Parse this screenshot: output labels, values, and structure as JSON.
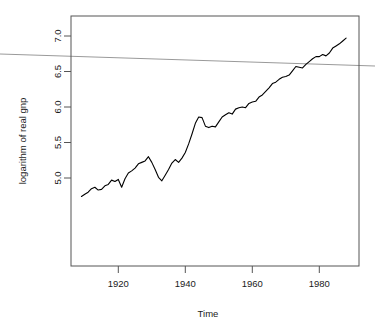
{
  "chart_data": {
    "type": "line",
    "title": "",
    "xlabel": "Time",
    "ylabel": "logarithm of real gnp",
    "xlim": [
      1906,
      1992
    ],
    "ylim": [
      4.52,
      7.28
    ],
    "xticks": [
      1920,
      1940,
      1960,
      1980
    ],
    "xtick_labels": [
      "1920",
      "1940",
      "1960",
      "1980"
    ],
    "yticks": [
      5.0,
      5.5,
      6.0,
      6.5,
      7.0
    ],
    "ytick_labels": [
      "5.0",
      "5.5",
      "6.0",
      "6.5",
      "7.0"
    ],
    "grid": false,
    "legend": null,
    "line_color": "#000000",
    "series": [
      {
        "name": "logarithm of real gnp",
        "x": [
          1909,
          1910,
          1911,
          1912,
          1913,
          1914,
          1915,
          1916,
          1917,
          1918,
          1919,
          1920,
          1921,
          1922,
          1923,
          1924,
          1925,
          1926,
          1927,
          1928,
          1929,
          1930,
          1931,
          1932,
          1933,
          1934,
          1935,
          1936,
          1937,
          1938,
          1939,
          1940,
          1941,
          1942,
          1943,
          1944,
          1945,
          1946,
          1947,
          1948,
          1949,
          1950,
          1951,
          1952,
          1953,
          1954,
          1955,
          1956,
          1957,
          1958,
          1959,
          1960,
          1961,
          1962,
          1963,
          1964,
          1965,
          1966,
          1967,
          1968,
          1969,
          1970,
          1971,
          1972,
          1973,
          1974,
          1975,
          1976,
          1977,
          1978,
          1979,
          1980,
          1981,
          1982,
          1983,
          1984,
          1985,
          1986,
          1987,
          1988
        ],
        "values": [
          4.74,
          4.77,
          4.8,
          4.85,
          4.87,
          4.83,
          4.84,
          4.89,
          4.91,
          4.97,
          4.95,
          4.98,
          4.87,
          4.99,
          5.07,
          5.1,
          5.14,
          5.2,
          5.22,
          5.24,
          5.3,
          5.22,
          5.12,
          5.01,
          4.96,
          5.04,
          5.12,
          5.21,
          5.26,
          5.22,
          5.28,
          5.36,
          5.48,
          5.62,
          5.77,
          5.86,
          5.85,
          5.73,
          5.71,
          5.73,
          5.72,
          5.79,
          5.86,
          5.89,
          5.92,
          5.9,
          5.97,
          5.99,
          6.0,
          5.99,
          6.05,
          6.07,
          6.08,
          6.14,
          6.17,
          6.22,
          6.27,
          6.33,
          6.35,
          6.39,
          6.42,
          6.43,
          6.45,
          6.51,
          6.57,
          6.56,
          6.55,
          6.6,
          6.64,
          6.68,
          6.71,
          6.71,
          6.74,
          6.72,
          6.76,
          6.83,
          6.86,
          6.89,
          6.93,
          6.97
        ],
        "points_px": "71,257 74,252 77,248 81,242 84,239 88,244 91,243 95,236 98,233 101,228 105,230 108,226 111,242 115,225 118,214 121,210 125,205 128,196 131,194 135,191 138,182 141,194 145,208 148,223 151,230 155,218 158,208 161,196 165,189 168,196 171,187 175,176 178,159 181,138 185,117 188,104 191,106 195,123 198,125 201,123 205,124 208,114 211,104 215,100 218,096 221,099 225,089 228,087 231,085 235,087 238,079 241,076 245,075 248,066 251,061 255,054 258,046 261,038 265,035 268,030 271,026 275,024 278,021 281,013 285,004 288,005 291,007 295,001 298,-4 301,-9 305,-13 308,-13 311,-17 315,-14 318,-20 321,-29 325,-33 328,-37 331,-42 335,-47"
      }
    ],
    "regression_line": {
      "name": "fitted trend line",
      "color": "#9a9a9a",
      "x_start": 1884.7,
      "y_start": 6.75,
      "x_end": 1996.7,
      "y_end": 6.58,
      "px_start": [
        0,
        54
      ],
      "px_end": [
        375,
        66
      ]
    }
  },
  "axes": {
    "x_title": "Time",
    "y_title": "logarithm of real gnp",
    "x_tick_labels": [
      "1920",
      "1940",
      "1960",
      "1980"
    ],
    "y_tick_labels": [
      "5.0",
      "5.5",
      "6.0",
      "6.5",
      "7.0"
    ]
  }
}
